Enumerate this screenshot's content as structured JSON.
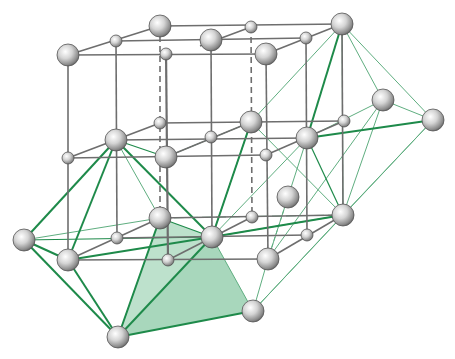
{
  "diagram": {
    "type": "crystal-lattice",
    "colors": {
      "background": "#ffffff",
      "lattice_line": "#6e6e6e",
      "green_line": "#1e8a4a",
      "green_line_light": "#5fae80",
      "polyhedron_fill": "#7cc49a",
      "sphere_light": "#ffffff",
      "sphere_mid": "#c8c8c8",
      "sphere_dark": "#6a6a6a"
    },
    "atoms": [
      {
        "id": "t1",
        "x": 68,
        "y": 55,
        "r": 11
      },
      {
        "id": "t2",
        "x": 116,
        "y": 41,
        "r": 6
      },
      {
        "id": "t3",
        "x": 160,
        "y": 26,
        "r": 11
      },
      {
        "id": "t4",
        "x": 200,
        "y": 46,
        "r": 6
      },
      {
        "id": "t5",
        "x": 211,
        "y": 40,
        "r": 11
      },
      {
        "id": "t6",
        "x": 251,
        "y": 27,
        "r": 6
      },
      {
        "id": "t7",
        "x": 266,
        "y": 54,
        "r": 11
      },
      {
        "id": "t8",
        "x": 306,
        "y": 38,
        "r": 6
      },
      {
        "id": "t9",
        "x": 342,
        "y": 24,
        "r": 11
      },
      {
        "id": "m1",
        "x": 68,
        "y": 158,
        "r": 6
      },
      {
        "id": "m2",
        "x": 116,
        "y": 140,
        "r": 11
      },
      {
        "id": "m3",
        "x": 160,
        "y": 123,
        "r": 6
      },
      {
        "id": "m4",
        "x": 166,
        "y": 157,
        "r": 11
      },
      {
        "id": "m5",
        "x": 211,
        "y": 137,
        "r": 6
      },
      {
        "id": "m6",
        "x": 251,
        "y": 122,
        "r": 11
      },
      {
        "id": "m7",
        "x": 266,
        "y": 155,
        "r": 6
      },
      {
        "id": "m8",
        "x": 307,
        "y": 138,
        "r": 11
      },
      {
        "id": "m9",
        "x": 344,
        "y": 121,
        "r": 6
      },
      {
        "id": "o1",
        "x": 383,
        "y": 100,
        "r": 11
      },
      {
        "id": "o2",
        "x": 433,
        "y": 120,
        "r": 11
      },
      {
        "id": "b0",
        "x": 24,
        "y": 240,
        "r": 11
      },
      {
        "id": "b1",
        "x": 68,
        "y": 260,
        "r": 11
      },
      {
        "id": "b2",
        "x": 117,
        "y": 238,
        "r": 6
      },
      {
        "id": "b3",
        "x": 160,
        "y": 218,
        "r": 11
      },
      {
        "id": "b4",
        "x": 168,
        "y": 260,
        "r": 6
      },
      {
        "id": "b5",
        "x": 212,
        "y": 237,
        "r": 11
      },
      {
        "id": "b6",
        "x": 252,
        "y": 217,
        "r": 6
      },
      {
        "id": "b7",
        "x": 268,
        "y": 259,
        "r": 11
      },
      {
        "id": "b8",
        "x": 307,
        "y": 235,
        "r": 6
      },
      {
        "id": "b9",
        "x": 343,
        "y": 215,
        "r": 11
      },
      {
        "id": "bx",
        "x": 288,
        "y": 197,
        "r": 11
      },
      {
        "id": "p1",
        "x": 118,
        "y": 337,
        "r": 11
      },
      {
        "id": "p2",
        "x": 253,
        "y": 311,
        "r": 11
      }
    ],
    "polyhedron": {
      "points": "118,337 160,218 212,237 253,311",
      "opacity": 0.45
    }
  }
}
